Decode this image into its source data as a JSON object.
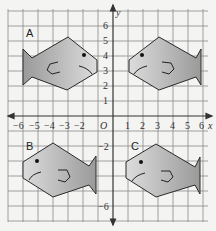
{
  "diagram": {
    "type": "coordinate-plane-transformations",
    "origin_px": [
      113,
      116
    ],
    "unit_px": 15,
    "grid_bounds_px": {
      "left": 8,
      "top": 9,
      "right": 208,
      "bottom": 222
    },
    "colors": {
      "background": "#f4f4f2",
      "grid": "#8a8a8a",
      "axis": "#333333",
      "fish_fill_light": "#d6d6d6",
      "fish_fill_dark": "#9a9a9a",
      "fish_stroke": "#2a2a2a"
    },
    "axes": {
      "x_label": "x",
      "y_label": "y",
      "origin_label": "O",
      "x_ticks_negative": [
        "−6",
        "−5",
        "−4",
        "−3",
        "−2"
      ],
      "x_ticks_positive": [
        "1",
        "2",
        "3",
        "4",
        "5",
        "6"
      ],
      "y_ticks_positive": [
        "6",
        "5",
        "4",
        "3",
        "2",
        "1"
      ],
      "y_ticks_negative": [
        "−2",
        "−6"
      ]
    },
    "fish": [
      {
        "label": "A",
        "quadrant": "II",
        "facing": "right"
      },
      {
        "label": "B",
        "quadrant": "III",
        "facing": "left"
      },
      {
        "label": "C",
        "quadrant": "IV",
        "facing": "left"
      },
      {
        "label": "",
        "quadrant": "I",
        "facing": "left"
      }
    ]
  }
}
